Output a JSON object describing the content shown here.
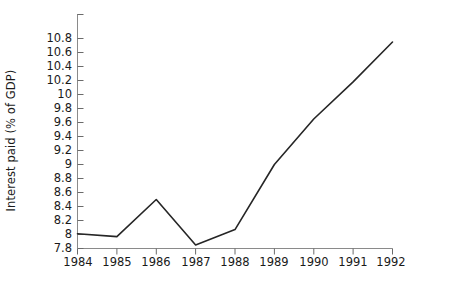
{
  "chart_data": {
    "type": "line",
    "title": "",
    "xlabel": "",
    "ylabel": "Interest paid (% of GDP)",
    "categories": [
      "1984",
      "1985",
      "1986",
      "1987",
      "1988",
      "1989",
      "1990",
      "1991",
      "1992"
    ],
    "x": [
      1984,
      1985,
      1986,
      1987,
      1988,
      1989,
      1990,
      1991,
      1992
    ],
    "values": [
      8.01,
      7.97,
      8.5,
      7.85,
      8.07,
      9.0,
      9.65,
      10.18,
      10.75
    ],
    "series": [
      {
        "name": "Interest paid (% of GDP)",
        "values": [
          8.01,
          7.97,
          8.5,
          7.85,
          8.07,
          9.0,
          9.65,
          10.18,
          10.75
        ]
      }
    ],
    "ylim": [
      7.8,
      10.8
    ],
    "yticks": [
      7.8,
      8,
      8.2,
      8.4,
      8.6,
      8.8,
      9,
      9.2,
      9.4,
      9.6,
      9.8,
      10,
      10.2,
      10.4,
      10.6,
      10.8
    ],
    "ytick_labels": [
      "7.8",
      "8",
      "8.2",
      "8.4",
      "8.6",
      "8.8",
      "9",
      "9.2",
      "9.4",
      "9.6",
      "9.8",
      "10",
      "10.2",
      "10.4",
      "10.6",
      "10.8"
    ],
    "xlim": [
      1984,
      1992
    ],
    "grid": false,
    "legend": null,
    "line_color": "#262626",
    "axis_color": "#808080"
  }
}
